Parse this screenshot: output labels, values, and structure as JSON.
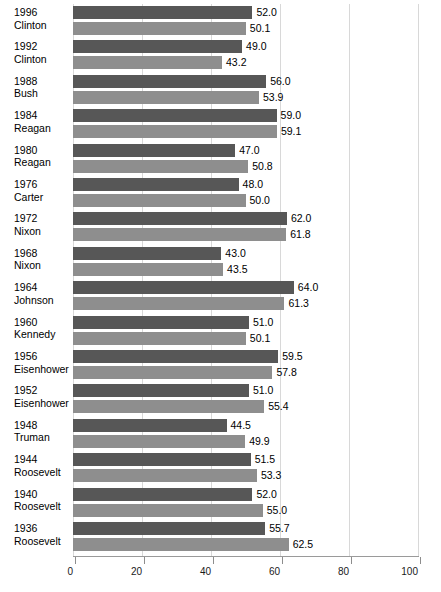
{
  "chart_data": {
    "type": "bar",
    "title": "",
    "xlabel": "",
    "ylabel": "",
    "orientation": "horizontal",
    "grid": true,
    "legend_position": "none",
    "xlim": [
      0,
      100
    ],
    "xticks": [
      "0",
      "20",
      "40",
      "60",
      "80",
      "100"
    ],
    "series": [
      {
        "name": "turnout",
        "color": "#575757",
        "values": [
          52.0,
          49.0,
          56.0,
          59.0,
          47.0,
          48.0,
          62.0,
          43.0,
          64.0,
          51.0,
          59.5,
          51.0,
          44.5,
          51.5,
          52.0,
          55.7
        ]
      },
      {
        "name": "winner",
        "color": "#8e8e8e",
        "values": [
          50.1,
          43.2,
          53.9,
          59.1,
          50.8,
          50.0,
          61.8,
          43.5,
          61.3,
          50.1,
          57.8,
          55.4,
          49.9,
          53.3,
          55.0,
          62.5
        ]
      }
    ],
    "categories": [
      {
        "year": "1996",
        "name": "Clinton",
        "turnout": "52.0",
        "winner": "50.1"
      },
      {
        "year": "1992",
        "name": "Clinton",
        "turnout": "49.0",
        "winner": "43.2"
      },
      {
        "year": "1988",
        "name": "Bush",
        "turnout": "56.0",
        "winner": "53.9"
      },
      {
        "year": "1984",
        "name": "Reagan",
        "turnout": "59.0",
        "winner": "59.1"
      },
      {
        "year": "1980",
        "name": "Reagan",
        "turnout": "47.0",
        "winner": "50.8"
      },
      {
        "year": "1976",
        "name": "Carter",
        "turnout": "48.0",
        "winner": "50.0"
      },
      {
        "year": "1972",
        "name": "Nixon",
        "turnout": "62.0",
        "winner": "61.8"
      },
      {
        "year": "1968",
        "name": "Nixon",
        "turnout": "43.0",
        "winner": "43.5"
      },
      {
        "year": "1964",
        "name": "Johnson",
        "turnout": "64.0",
        "winner": "61.3"
      },
      {
        "year": "1960",
        "name": "Kennedy",
        "turnout": "51.0",
        "winner": "50.1"
      },
      {
        "year": "1956",
        "name": "Eisenhower",
        "turnout": "59.5",
        "winner": "57.8"
      },
      {
        "year": "1952",
        "name": "Eisenhower",
        "turnout": "51.0",
        "winner": "55.4"
      },
      {
        "year": "1948",
        "name": "Truman",
        "turnout": "44.5",
        "winner": "49.9"
      },
      {
        "year": "1944",
        "name": "Roosevelt",
        "turnout": "51.5",
        "winner": "53.3"
      },
      {
        "year": "1940",
        "name": "Roosevelt",
        "turnout": "52.0",
        "winner": "55.0"
      },
      {
        "year": "1936",
        "name": "Roosevelt",
        "turnout": "55.7",
        "winner": "62.5"
      }
    ]
  }
}
